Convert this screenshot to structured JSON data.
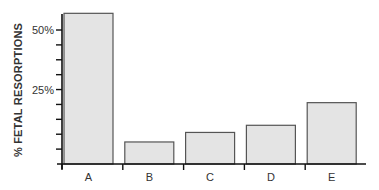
{
  "chart_data": {
    "type": "bar",
    "title": "",
    "xlabel": "",
    "ylabel": "% FETAL RESORPTIONS",
    "categories": [
      "A",
      "B",
      "C",
      "D",
      "E"
    ],
    "values": [
      57,
      3,
      7,
      10,
      19.5
    ],
    "unit": "%",
    "ylim": [
      -6.25,
      57
    ],
    "y_ticks": [
      -6.25,
      0,
      6.25,
      12.5,
      18.75,
      25,
      31.25,
      37.5,
      43.75,
      50
    ],
    "y_tick_labels": [
      {
        "value": 25,
        "label": "25%"
      },
      {
        "value": 50,
        "label": "50%"
      }
    ],
    "grid": false,
    "legend": "none",
    "colors": {
      "bar_fill": "#e4e4e4",
      "bar_stroke": "#555555",
      "axis": "#111111"
    }
  }
}
